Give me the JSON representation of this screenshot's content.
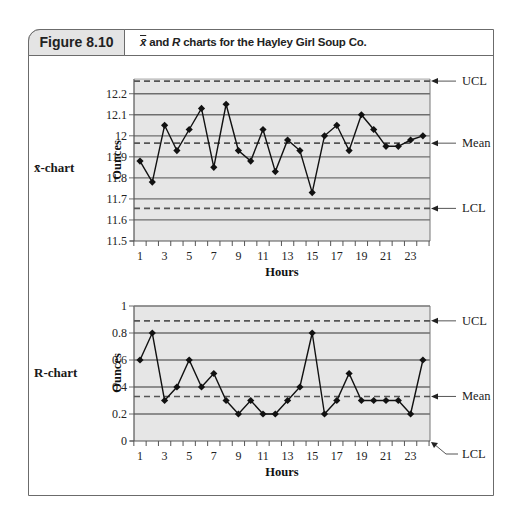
{
  "figure": {
    "label": "Figure 8.10",
    "title_parts": [
      "x̄",
      " and ",
      "R",
      " charts for the Hayley Girl Soup Co."
    ]
  },
  "colors": {
    "plot_bg": "#e6e6e6",
    "grid": "#6e6e6e",
    "control_line": "#555555",
    "series": "#111111",
    "frame": "#6b6b6b",
    "label_bg": "#e4e4e4"
  },
  "chart_data": [
    {
      "type": "line",
      "name": "x-bar chart",
      "side_label": "x̄-chart",
      "title": "",
      "xlabel": "Hours",
      "ylabel": "Ounces",
      "x": [
        1,
        2,
        3,
        4,
        5,
        6,
        7,
        8,
        9,
        10,
        11,
        12,
        13,
        14,
        15,
        16,
        17,
        18,
        19,
        20,
        21,
        22,
        23,
        24
      ],
      "x_tick_labels": [
        "1",
        "3",
        "5",
        "7",
        "9",
        "11",
        "13",
        "15",
        "17",
        "19",
        "21",
        "23"
      ],
      "y_ticks": [
        11.5,
        11.6,
        11.7,
        11.8,
        11.9,
        12.0,
        12.1,
        12.2
      ],
      "y_tick_labels": [
        "11.5",
        "11.6",
        "11.7",
        "11.8",
        "11.9",
        "12",
        "12.1",
        "12.2"
      ],
      "ylim": [
        11.5,
        12.27
      ],
      "grid": true,
      "series": [
        {
          "name": "Sample mean",
          "values": [
            11.88,
            11.78,
            12.05,
            11.93,
            12.03,
            12.13,
            11.85,
            12.15,
            11.93,
            11.88,
            12.03,
            11.83,
            11.98,
            11.93,
            11.73,
            12.0,
            12.05,
            11.93,
            12.1,
            12.03,
            11.95,
            11.95,
            11.98,
            12.0
          ]
        }
      ],
      "control_lines": [
        {
          "label": "UCL",
          "value": 12.26
        },
        {
          "label": "Mean",
          "value": 11.965
        },
        {
          "label": "LCL",
          "value": 11.655
        }
      ]
    },
    {
      "type": "line",
      "name": "R chart",
      "side_label": "R-chart",
      "title": "",
      "xlabel": "Hours",
      "ylabel": "Ounces",
      "x": [
        1,
        2,
        3,
        4,
        5,
        6,
        7,
        8,
        9,
        10,
        11,
        12,
        13,
        14,
        15,
        16,
        17,
        18,
        19,
        20,
        21,
        22,
        23,
        24
      ],
      "x_tick_labels": [
        "1",
        "3",
        "5",
        "7",
        "9",
        "11",
        "13",
        "15",
        "17",
        "19",
        "21",
        "23"
      ],
      "y_ticks": [
        0,
        0.2,
        0.4,
        0.6,
        0.8,
        1
      ],
      "y_tick_labels": [
        "0",
        "0.2",
        "0.4",
        "0.6",
        "0.8",
        "1"
      ],
      "ylim": [
        0,
        1
      ],
      "grid": true,
      "series": [
        {
          "name": "Range",
          "values": [
            0.6,
            0.8,
            0.3,
            0.4,
            0.6,
            0.4,
            0.5,
            0.3,
            0.2,
            0.3,
            0.2,
            0.2,
            0.3,
            0.4,
            0.8,
            0.2,
            0.3,
            0.5,
            0.3,
            0.3,
            0.3,
            0.3,
            0.2,
            0.6
          ]
        }
      ],
      "control_lines": [
        {
          "label": "UCL",
          "value": 0.89
        },
        {
          "label": "Mean",
          "value": 0.33
        },
        {
          "label": "LCL",
          "value": 0
        }
      ]
    }
  ]
}
